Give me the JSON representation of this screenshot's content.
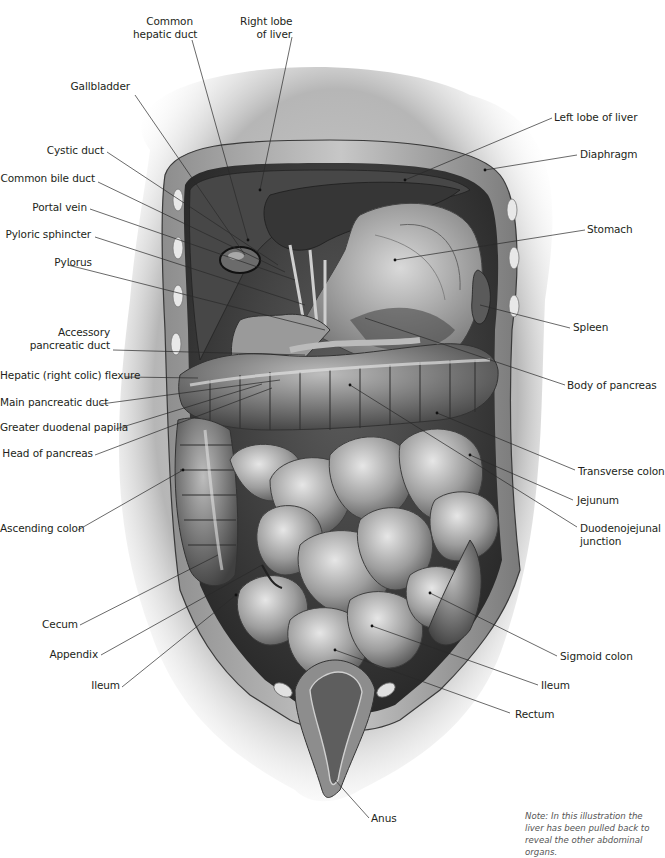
{
  "figure": {
    "type": "anatomical-illustration",
    "palette": {
      "background": "#ffffff",
      "label_text": "#231f20",
      "leader_line": "#2a2a2a",
      "tissue_dark": "#3a3a3a",
      "tissue_mid": "#8a8a8a",
      "tissue_light": "#d6d6d6",
      "note_text": "#555555"
    }
  },
  "labels_left": [
    {
      "id": "common-hepatic-duct",
      "text_lines": [
        "Common",
        "hepatic duct"
      ]
    },
    {
      "id": "right-lobe-of-liver",
      "text_lines": [
        "Right lobe",
        "of liver"
      ]
    },
    {
      "id": "gallbladder",
      "text_lines": [
        "Gallbladder"
      ]
    },
    {
      "id": "cystic-duct",
      "text_lines": [
        "Cystic duct"
      ]
    },
    {
      "id": "common-bile-duct",
      "text_lines": [
        "Common bile duct"
      ]
    },
    {
      "id": "portal-vein",
      "text_lines": [
        "Portal vein"
      ]
    },
    {
      "id": "pyloric-sphincter",
      "text_lines": [
        "Pyloric sphincter"
      ]
    },
    {
      "id": "pylorus",
      "text_lines": [
        "Pylorus"
      ]
    },
    {
      "id": "accessory-pancreatic-duct",
      "text_lines": [
        "Accessory",
        "pancreatic duct"
      ]
    },
    {
      "id": "hepatic-flexure",
      "text_lines": [
        "Hepatic (right colic) flexure"
      ]
    },
    {
      "id": "main-pancreatic-duct",
      "text_lines": [
        "Main pancreatic duct"
      ]
    },
    {
      "id": "greater-duodenal-papilla",
      "text_lines": [
        "Greater duodenal papilla"
      ]
    },
    {
      "id": "head-of-pancreas",
      "text_lines": [
        "Head of pancreas"
      ]
    },
    {
      "id": "ascending-colon",
      "text_lines": [
        "Ascending colon"
      ]
    },
    {
      "id": "cecum",
      "text_lines": [
        "Cecum"
      ]
    },
    {
      "id": "appendix",
      "text_lines": [
        "Appendix"
      ]
    },
    {
      "id": "ileum-left",
      "text_lines": [
        "Ileum"
      ]
    }
  ],
  "labels_right": [
    {
      "id": "left-lobe-of-liver",
      "text_lines": [
        "Left lobe of liver"
      ]
    },
    {
      "id": "diaphragm",
      "text_lines": [
        "Diaphragm"
      ]
    },
    {
      "id": "stomach",
      "text_lines": [
        "Stomach"
      ]
    },
    {
      "id": "spleen",
      "text_lines": [
        "Spleen"
      ]
    },
    {
      "id": "body-of-pancreas",
      "text_lines": [
        "Body of pancreas"
      ]
    },
    {
      "id": "transverse-colon",
      "text_lines": [
        "Transverse colon"
      ]
    },
    {
      "id": "jejunum",
      "text_lines": [
        "Jejunum"
      ]
    },
    {
      "id": "duodenojejunal-junction",
      "text_lines": [
        "Duodenojejunal",
        "junction"
      ]
    },
    {
      "id": "sigmoid-colon",
      "text_lines": [
        "Sigmoid colon"
      ]
    },
    {
      "id": "ileum-right",
      "text_lines": [
        "Ileum"
      ]
    },
    {
      "id": "rectum",
      "text_lines": [
        "Rectum"
      ]
    },
    {
      "id": "anus",
      "text_lines": [
        "Anus"
      ]
    }
  ],
  "note": {
    "text": "Note: In this illustration the liver has been pulled back to reveal the other abdominal organs."
  }
}
